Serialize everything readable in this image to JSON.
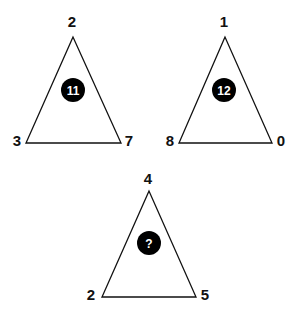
{
  "puzzle": {
    "triangles": [
      {
        "top": "2",
        "bottom_left": "3",
        "bottom_right": "7",
        "center": "11"
      },
      {
        "top": "1",
        "bottom_left": "8",
        "bottom_right": "0",
        "center": "12"
      },
      {
        "top": "4",
        "bottom_left": "2",
        "bottom_right": "5",
        "center": "?"
      }
    ],
    "colors": {
      "line": "#111111",
      "circle": "#000000",
      "circle_text": "#ffffff",
      "background": "#ffffff"
    }
  }
}
